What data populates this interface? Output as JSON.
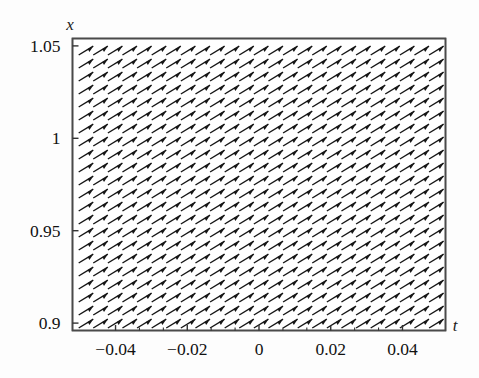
{
  "figure": {
    "kind": "direction-field",
    "background_color": "#fdfdfd",
    "frame_color": "#4a4a4a",
    "arrow_color": "#161616"
  },
  "chart_data": {
    "type": "scatter",
    "subtype": "direction-field",
    "title": "",
    "xlabel": "t",
    "ylabel": "x",
    "xlim": [
      -0.052,
      0.052
    ],
    "ylim": [
      0.896,
      1.054
    ],
    "grid": false,
    "legend": null,
    "xticks": [
      -0.04,
      -0.02,
      0,
      0.02,
      0.04
    ],
    "xticklabels": [
      "-0.04",
      "-0.02",
      "0",
      "0.02",
      "0.04"
    ],
    "yticks": [
      0.9,
      0.95,
      1,
      1.05
    ],
    "yticklabels": [
      "0.9",
      "0.95",
      "1",
      "1.05"
    ],
    "x_minor_tick_count": 2,
    "y_minor_tick_count": 0,
    "arrow_grid": {
      "columns": 25,
      "rows": 22,
      "arrow_angle_deg": 31,
      "arrow_length_px": 17,
      "description": "uniform up-right slope field arrows"
    },
    "annotations": []
  },
  "axes": {
    "x_axis_label": "t",
    "y_axis_label": "x"
  }
}
